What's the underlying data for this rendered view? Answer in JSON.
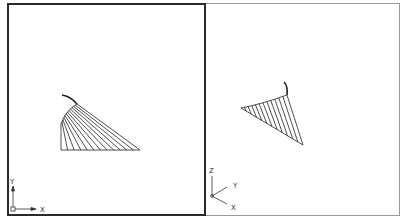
{
  "app": "CAD drawing viewports",
  "viewports": [
    {
      "name": "left",
      "view": "top (plan)",
      "active": true,
      "ucs_axes": {
        "axis1": "X",
        "axis2": "Y"
      }
    },
    {
      "name": "right",
      "view": "isometric",
      "active": false,
      "ucs_axes": {
        "axis1": "X",
        "axis2": "Y",
        "axis3": "Z"
      }
    }
  ],
  "colors": {
    "active_border": "#2a2a2a",
    "inactive_border": "#9a9a9a",
    "geometry": "#222222"
  }
}
